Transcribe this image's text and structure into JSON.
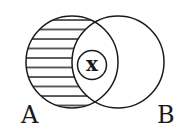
{
  "diagram": {
    "type": "venn",
    "sets": [
      {
        "name": "A",
        "label": "A",
        "shaded": "A minus B (horizontal hatching)"
      },
      {
        "name": "B",
        "label": "B",
        "shaded": "none"
      }
    ],
    "element": {
      "label": "x",
      "region": "A ∩ B"
    },
    "colors": {
      "stroke": "#1a1a1a",
      "background": "#ffffff",
      "hatch": "#1a1a1a"
    }
  }
}
